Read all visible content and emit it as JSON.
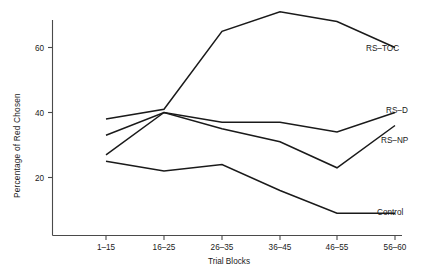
{
  "chart_data": {
    "type": "line",
    "title": "",
    "xlabel": "Trial Blocks",
    "ylabel": "Percentage of Red Chosen",
    "categories": [
      "1–15",
      "16–25",
      "26–35",
      "36–45",
      "46–55",
      "56–60"
    ],
    "yticks": [
      20,
      40,
      60
    ],
    "ylim": [
      0,
      75
    ],
    "grid": false,
    "legend_position": "right-inline-labels",
    "series": [
      {
        "name": "RS–TOC",
        "values": [
          38,
          41,
          65,
          71,
          68,
          60
        ]
      },
      {
        "name": "RS–D",
        "values": [
          33,
          40,
          37,
          37,
          34,
          40
        ]
      },
      {
        "name": "RS–NP",
        "values": [
          27,
          40,
          35,
          31,
          23,
          36
        ]
      },
      {
        "name": "Control",
        "values": [
          25,
          22,
          24,
          16,
          9,
          9
        ]
      }
    ]
  },
  "axis": {
    "y_tick_labels": [
      "60",
      "40",
      "20"
    ],
    "x_tick_labels": [
      "1–15",
      "16–25",
      "26–35",
      "36–45",
      "46–55",
      "56–60"
    ],
    "x_title": "Trial Blocks",
    "y_title": "Percentage of Red Chosen"
  },
  "series_labels": {
    "rs_toc": "RS–TOC",
    "rs_d": "RS–D",
    "rs_np": "RS–NP",
    "control": "Control"
  },
  "colors": {
    "line": "#1a1a1a",
    "axis": "#4a4a4a",
    "text": "#1a1a1a",
    "background": "#ffffff"
  }
}
